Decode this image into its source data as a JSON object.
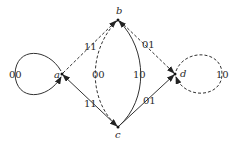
{
  "diagram": {
    "type": "state-transition-graph",
    "nodes": [
      {
        "id": "a",
        "label": "a",
        "x": 62,
        "y": 74
      },
      {
        "id": "b",
        "label": "b",
        "x": 118,
        "y": 20
      },
      {
        "id": "c",
        "label": "c",
        "x": 118,
        "y": 127
      },
      {
        "id": "d",
        "label": "d",
        "x": 175,
        "y": 74
      }
    ],
    "edges": [
      {
        "from": "a",
        "to": "a",
        "label": "00",
        "style": "solid",
        "shape": "self-loop-left"
      },
      {
        "from": "a",
        "to": "b",
        "label": "11",
        "style": "dashed"
      },
      {
        "from": "b",
        "to": "d",
        "label": "01",
        "style": "dashed"
      },
      {
        "from": "a",
        "to": "c",
        "label": "11",
        "style": "solid"
      },
      {
        "from": "c",
        "to": "d",
        "label": "01",
        "style": "solid"
      },
      {
        "from": "b",
        "to": "c",
        "label": "00",
        "style": "dashed",
        "shape": "curve-left"
      },
      {
        "from": "c",
        "to": "b",
        "label": "10",
        "style": "solid",
        "shape": "curve-right"
      },
      {
        "from": "d",
        "to": "d",
        "label": "10",
        "style": "dashed",
        "shape": "self-loop-right"
      }
    ]
  },
  "labels": {
    "node_a": "a",
    "node_b": "b",
    "node_c": "c",
    "node_d": "d",
    "loop_a": "00",
    "edge_ab": "11",
    "edge_bd": "01",
    "edge_ac": "11",
    "edge_cd": "01",
    "edge_bc_dashed": "00",
    "edge_bc_solid": "10",
    "loop_d": "10"
  }
}
